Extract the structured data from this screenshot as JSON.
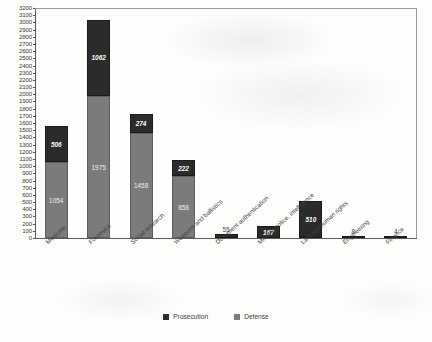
{
  "chart_data": {
    "type": "bar",
    "subtype": "stacked-bar",
    "title": "",
    "xlabel": "",
    "ylabel": "",
    "ylim": [
      0,
      3200
    ],
    "ytick_step": 100,
    "grid": false,
    "legend_position": "bottom-center",
    "categories": [
      "Medicine",
      "Forensics",
      "Social research",
      "Weapons and ballistics",
      "Document authentication",
      "Military, police, intelligence",
      "Law and human rights",
      "Engineering",
      "Finance"
    ],
    "series": [
      {
        "name": "Prosecution",
        "color": "#2b2b2b",
        "values": [
          506,
          1062,
          274,
          222,
          55,
          167,
          510,
          8,
          4
        ]
      },
      {
        "name": "Defense",
        "color": "#7b7b7b",
        "values": [
          1054,
          1975,
          1458,
          858,
          0,
          0,
          0,
          0,
          0
        ]
      }
    ],
    "yticks": [
      "3200",
      "3100",
      "3000",
      "2900",
      "2800",
      "2700",
      "2600",
      "2500",
      "2400",
      "2300",
      "2200",
      "2100",
      "2000",
      "1900",
      "1800",
      "1700",
      "1600",
      "1500",
      "1400",
      "1300",
      "1200",
      "1100",
      "1000",
      "900",
      "800",
      "700",
      "600",
      "500",
      "400",
      "300",
      "200",
      "100",
      "0"
    ],
    "legend": [
      {
        "label": "Prosecution",
        "color": "#2b2b2b"
      },
      {
        "label": "Defense",
        "color": "#7b7b7b"
      }
    ]
  }
}
